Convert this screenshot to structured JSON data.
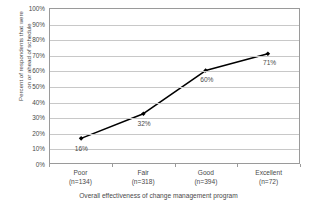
{
  "chart_data": {
    "type": "line",
    "title": "",
    "xlabel": "Overall effectiveness of change management program",
    "ylabel": "Percent of respondents that were on or ahead of schedule",
    "ylabel_line1": "Percent of respondents that were",
    "ylabel_line2": "on or ahead of schedule",
    "categories": [
      "Poor",
      "Fair",
      "Good",
      "Excellent"
    ],
    "category_sublabels": [
      "(n=134)",
      "(n=318)",
      "(n=394)",
      "(n=72)"
    ],
    "sample_sizes": [
      134,
      318,
      394,
      72
    ],
    "values": [
      16,
      32,
      60,
      71
    ],
    "data_labels": [
      "16%",
      "32%",
      "60%",
      "71%"
    ],
    "ylim": [
      0,
      100
    ],
    "ytick_values": [
      0,
      10,
      20,
      30,
      40,
      50,
      60,
      70,
      80,
      90,
      100
    ],
    "ytick_labels": [
      "0%",
      "10%",
      "20%",
      "30%",
      "40%",
      "50%",
      "60%",
      "70%",
      "80%",
      "90%",
      "100%"
    ],
    "grid": true,
    "grid_axis": "y",
    "legend": false,
    "legend_position": "none",
    "marker": "diamond",
    "series_color": "#000000",
    "gridline_color": "#c8c8c8",
    "axis_color": "#9a9a9a",
    "background_color": "#ffffff",
    "text_color": "#4a4a4a"
  }
}
